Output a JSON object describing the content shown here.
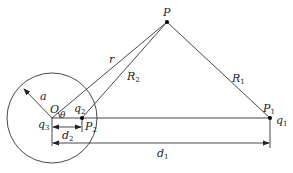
{
  "diagram": {
    "title": "",
    "points": {
      "O": {
        "label": "O",
        "x": 52,
        "y": 118
      },
      "P": {
        "label": "P",
        "x": 167,
        "y": 22
      },
      "P1": {
        "label": "P",
        "sub": "1",
        "x": 270,
        "y": 118
      },
      "P2": {
        "label": "P",
        "sub": "2",
        "x": 82,
        "y": 118
      }
    },
    "circle": {
      "cx": 52,
      "cy": 118,
      "r": 45
    },
    "labels": {
      "a": "a",
      "r": "r",
      "R2": {
        "main": "R",
        "sub": "2"
      },
      "R1": {
        "main": "R",
        "sub": "1"
      },
      "theta": "θ",
      "q1": {
        "main": "q",
        "sub": "1"
      },
      "q2": {
        "main": "q",
        "sub": "2"
      },
      "q3": {
        "main": "q",
        "sub": "3"
      },
      "d1": {
        "main": "d",
        "sub": "1"
      },
      "d2": {
        "main": "d",
        "sub": "2"
      },
      "O": "O",
      "P": "P",
      "P1": {
        "main": "P",
        "sub": "1"
      },
      "P2": {
        "main": "P",
        "sub": "2"
      }
    }
  }
}
